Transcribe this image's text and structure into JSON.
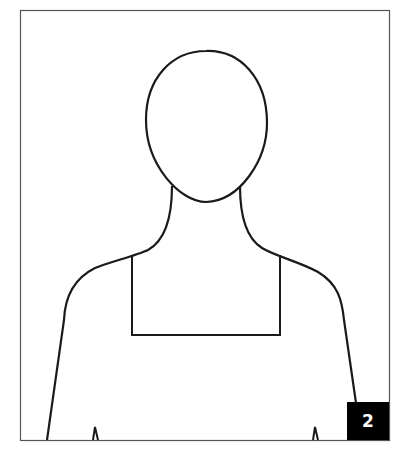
{
  "figure": {
    "badge_number": "2",
    "stroke_color": "#1a1a1a",
    "frame_color": "#555555",
    "badge_bg": "#000000",
    "badge_fg": "#ffffff"
  }
}
